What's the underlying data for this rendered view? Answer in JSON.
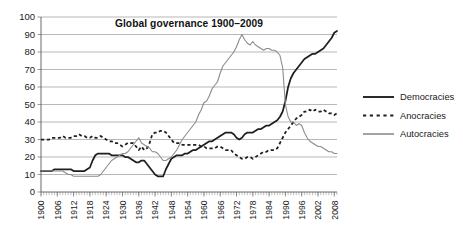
{
  "chart_data": {
    "type": "line",
    "title": "Global governance 1900–2009",
    "xlabel": "",
    "ylabel": "",
    "xlim": [
      1900,
      2009
    ],
    "ylim": [
      0,
      100
    ],
    "ytick_values": [
      0,
      10,
      20,
      30,
      40,
      50,
      60,
      70,
      80,
      90,
      100
    ],
    "ytick_labels": [
      "0",
      "10",
      "20",
      "30",
      "40",
      "50",
      "60",
      "70",
      "80",
      "90",
      "100"
    ],
    "xtick_values": [
      1900,
      1906,
      1912,
      1918,
      1924,
      1930,
      1936,
      1942,
      1948,
      1954,
      1960,
      1966,
      1972,
      1978,
      1984,
      1990,
      1996,
      2002,
      2008
    ],
    "xtick_labels": [
      "1900",
      "1906",
      "1912",
      "1918",
      "1924",
      "1930",
      "1936",
      "1942",
      "1948",
      "1954",
      "1960",
      "1966",
      "1972",
      "1978",
      "1984",
      "1990",
      "1996",
      "2002",
      "2008"
    ],
    "grid": "horizontal",
    "legend_position": "right",
    "x": [
      1900,
      1901,
      1902,
      1903,
      1904,
      1905,
      1906,
      1907,
      1908,
      1909,
      1910,
      1911,
      1912,
      1913,
      1914,
      1915,
      1916,
      1917,
      1918,
      1919,
      1920,
      1921,
      1922,
      1923,
      1924,
      1925,
      1926,
      1927,
      1928,
      1929,
      1930,
      1931,
      1932,
      1933,
      1934,
      1935,
      1936,
      1937,
      1938,
      1939,
      1940,
      1941,
      1942,
      1943,
      1944,
      1945,
      1946,
      1947,
      1948,
      1949,
      1950,
      1951,
      1952,
      1953,
      1954,
      1955,
      1956,
      1957,
      1958,
      1959,
      1960,
      1961,
      1962,
      1963,
      1964,
      1965,
      1966,
      1967,
      1968,
      1969,
      1970,
      1971,
      1972,
      1973,
      1974,
      1975,
      1976,
      1977,
      1978,
      1979,
      1980,
      1981,
      1982,
      1983,
      1984,
      1985,
      1986,
      1987,
      1988,
      1989,
      1990,
      1991,
      1992,
      1993,
      1994,
      1995,
      1996,
      1997,
      1998,
      1999,
      2000,
      2001,
      2002,
      2003,
      2004,
      2005,
      2006,
      2007,
      2008,
      2009
    ],
    "series": [
      {
        "name": "Democracies",
        "style": "solid-thick-dark",
        "color": "#1f1f1f",
        "values": [
          12,
          12,
          12,
          12,
          12,
          13,
          13,
          13,
          13,
          13,
          13,
          13,
          12,
          12,
          12,
          12,
          12,
          13,
          14,
          18,
          21,
          22,
          22,
          22,
          22,
          22,
          21,
          21,
          21,
          21,
          21,
          20,
          20,
          19,
          18,
          17,
          17,
          18,
          18,
          16,
          14,
          12,
          10,
          9,
          9,
          9,
          13,
          16,
          19,
          20,
          21,
          21,
          21,
          22,
          22,
          23,
          24,
          24,
          25,
          26,
          27,
          28,
          29,
          29,
          30,
          31,
          32,
          33,
          34,
          34,
          34,
          33,
          31,
          30,
          31,
          33,
          34,
          34,
          34,
          35,
          36,
          36,
          37,
          38,
          38,
          39,
          40,
          41,
          43,
          46,
          52,
          60,
          65,
          68,
          70,
          72,
          74,
          76,
          77,
          78,
          79,
          79,
          80,
          81,
          82,
          84,
          86,
          88,
          91,
          92
        ]
      },
      {
        "name": "Anocracies",
        "style": "dashed-dark",
        "color": "#1f1f1f",
        "values": [
          30,
          30,
          30,
          30,
          31,
          31,
          31,
          31,
          32,
          31,
          31,
          31,
          32,
          32,
          33,
          32,
          32,
          31,
          31,
          32,
          31,
          31,
          32,
          31,
          30,
          29,
          29,
          28,
          28,
          27,
          26,
          27,
          28,
          28,
          28,
          26,
          24,
          26,
          24,
          25,
          28,
          33,
          34,
          34,
          35,
          35,
          34,
          32,
          30,
          28,
          28,
          28,
          27,
          27,
          27,
          27,
          27,
          27,
          27,
          26,
          26,
          25,
          25,
          25,
          25,
          26,
          26,
          25,
          24,
          24,
          24,
          22,
          21,
          20,
          19,
          19,
          20,
          20,
          19,
          20,
          21,
          22,
          23,
          23,
          24,
          24,
          24,
          25,
          28,
          31,
          34,
          36,
          38,
          40,
          42,
          43,
          44,
          46,
          46,
          47,
          46,
          47,
          46,
          46,
          47,
          46,
          45,
          45,
          44,
          45
        ]
      },
      {
        "name": "Autocracies",
        "style": "solid-thin-gray",
        "color": "#8c8c8c",
        "values": [
          12,
          12,
          12,
          12,
          12,
          12,
          12,
          12,
          12,
          11,
          10,
          10,
          9,
          9,
          9,
          9,
          9,
          9,
          9,
          9,
          9,
          9,
          10,
          12,
          14,
          16,
          18,
          19,
          20,
          21,
          22,
          22,
          23,
          25,
          27,
          29,
          31,
          28,
          27,
          26,
          25,
          23,
          23,
          22,
          20,
          18,
          18,
          19,
          20,
          22,
          24,
          27,
          30,
          32,
          34,
          36,
          38,
          40,
          44,
          47,
          51,
          52,
          55,
          59,
          61,
          63,
          68,
          72,
          74,
          76,
          78,
          80,
          83,
          87,
          90,
          87,
          85,
          84,
          86,
          84,
          83,
          82,
          81,
          82,
          82,
          81,
          81,
          80,
          78,
          71,
          50,
          43,
          40,
          40,
          38,
          39,
          38,
          34,
          31,
          29,
          28,
          27,
          26,
          26,
          25,
          24,
          23,
          23,
          22,
          22
        ]
      }
    ]
  },
  "legend": {
    "items": [
      {
        "label": "Democracies",
        "style": "solid-thick-dark"
      },
      {
        "label": "Anocracies",
        "style": "dashed-dark"
      },
      {
        "label": "Autocracies",
        "style": "solid-thin-gray"
      }
    ]
  }
}
